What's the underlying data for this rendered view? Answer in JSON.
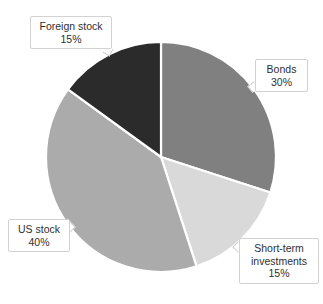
{
  "chart_data": {
    "type": "pie",
    "title": "",
    "xlabel": "",
    "ylabel": "",
    "legend_position": "none",
    "grid": false,
    "units": "percent",
    "total": 100,
    "categories": [
      "Bonds",
      "Short-term investments",
      "US stock",
      "Foreign stock"
    ],
    "values": [
      30,
      15,
      40,
      15
    ],
    "colors": [
      "#808080",
      "#d9d9d9",
      "#ababab",
      "#2b2b2b"
    ],
    "slice_separator_color": "#ffffff",
    "start_angle_deg": 0,
    "direction": "clockwise",
    "slices": [
      {
        "label": "Bonds",
        "value": 30,
        "value_text": "30%",
        "color": "#808080",
        "start_angle_deg": 0,
        "end_angle_deg": 108
      },
      {
        "label": "Short-term investments",
        "value": 15,
        "value_text": "15%",
        "color": "#d9d9d9",
        "start_angle_deg": 108,
        "end_angle_deg": 162
      },
      {
        "label": "US stock",
        "value": 40,
        "value_text": "40%",
        "color": "#ababab",
        "start_angle_deg": 162,
        "end_angle_deg": 306
      },
      {
        "label": "Foreign stock",
        "value": 15,
        "value_text": "15%",
        "color": "#2b2b2b",
        "start_angle_deg": 306,
        "end_angle_deg": 360
      }
    ]
  },
  "callouts": {
    "foreign_stock": {
      "name": "Foreign stock",
      "value_text": "15%"
    },
    "bonds": {
      "name": "Bonds",
      "value_text": "30%"
    },
    "short_term": {
      "name_line1": "Short-term",
      "name_line2": "investments",
      "value_text": "15%"
    },
    "us_stock": {
      "name": "US stock",
      "value_text": "40%"
    }
  }
}
